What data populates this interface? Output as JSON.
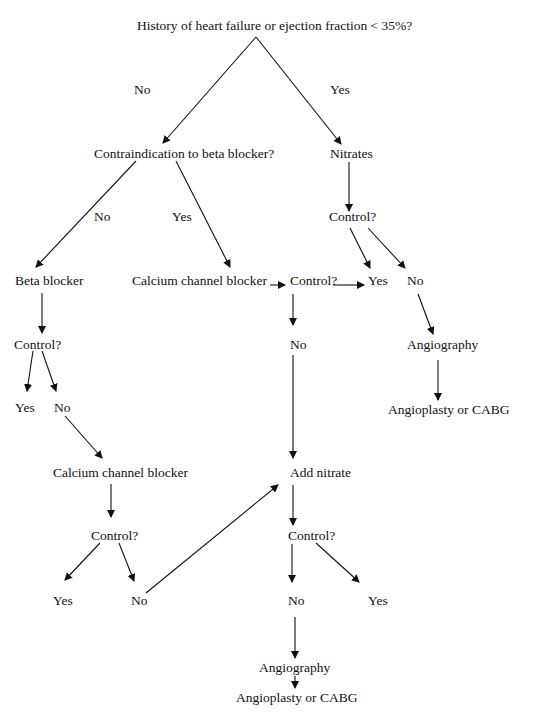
{
  "diagram": {
    "title": "History of heart failure or ejection fraction < 35%?",
    "nodes": {
      "root": "History of heart failure or ejection fraction < 35%?",
      "root_no": "No",
      "root_yes": "Yes",
      "contraindication": "Contraindication to beta blocker?",
      "nitrates": "Nitrates",
      "ci_no": "No",
      "ci_yes": "Yes",
      "nitrates_control": "Control?",
      "beta_blocker": "Beta blocker",
      "ccb_main": "Calcium channel blocker",
      "ccb_control": "Control?",
      "shared_yes": "Yes",
      "nitrates_no": "No",
      "bb_control": "Control?",
      "ccb_control_no": "No",
      "angiography_right": "Angiography",
      "bb_yes": "Yes",
      "bb_no": "No",
      "angioplasty_right": "Angioplasty or CABG",
      "ccb_second": "Calcium channel blocker",
      "add_nitrate": "Add nitrate",
      "ccb2_control": "Control?",
      "an_control": "Control?",
      "ccb2_yes": "Yes",
      "ccb2_no": "No",
      "an_no": "No",
      "an_yes": "Yes",
      "angiography_bottom": "Angiography",
      "angioplasty_bottom": "Angioplasty or CABG"
    }
  }
}
